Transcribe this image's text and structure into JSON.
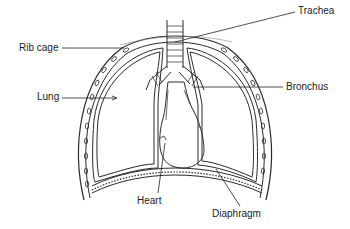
{
  "diagram": {
    "labels": {
      "trachea": "Trachea",
      "rib_cage": "Rib cage",
      "lung": "Lung",
      "bronchus": "Bronchus",
      "heart": "Heart",
      "diaphragm": "Diaphragm"
    },
    "colors": {
      "ink": "#222222",
      "background": "#ffffff"
    }
  }
}
